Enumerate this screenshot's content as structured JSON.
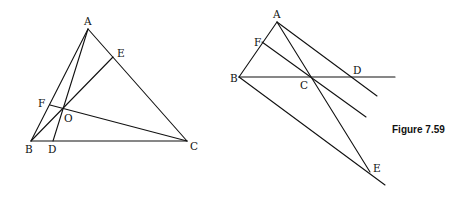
{
  "caption": "Figure 7.59",
  "figure_left": {
    "points": {
      "A": "A",
      "B": "B",
      "C": "C",
      "D": "D",
      "E": "E",
      "F": "F",
      "O": "O"
    },
    "segments": [
      "AB",
      "BC",
      "CA",
      "AD",
      "BE",
      "CF"
    ]
  },
  "figure_right": {
    "points": {
      "A": "A",
      "B": "B",
      "C": "C",
      "D": "D",
      "E": "E",
      "F": "F"
    },
    "segments": [
      "AB",
      "BD",
      "AD",
      "FC",
      "AE",
      "BE"
    ]
  }
}
